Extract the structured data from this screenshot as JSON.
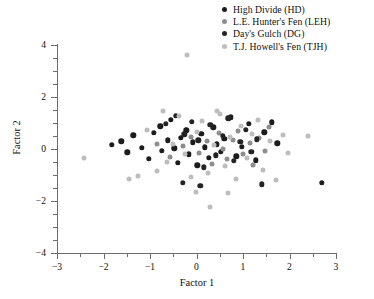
{
  "figure": {
    "title": "",
    "background": "#ffffff"
  },
  "legend": {
    "position": "top-right",
    "entries": [
      {
        "label": "High Divide (HD)",
        "key": "HD",
        "color": "#1c1c1c",
        "marker": "circle"
      },
      {
        "label": "L.E. Hunter's Fen (LEH)",
        "key": "LEH",
        "color": "#8e8e8e",
        "marker": "circle"
      },
      {
        "label": "Day's Gulch (DG)",
        "key": "DG",
        "color": "#242424",
        "marker": "circle"
      },
      {
        "label": "T.J. Howell's Fen (TJH)",
        "key": "TJH",
        "color": "#bdbdbd",
        "marker": "circle"
      }
    ]
  },
  "axes": {
    "xlabel": "Factor 1",
    "ylabel": "Factor 2",
    "xlim": [
      -3,
      3
    ],
    "ylim": [
      -4,
      4
    ],
    "xticks": [
      -3,
      -2,
      -1,
      0,
      1,
      2,
      3
    ],
    "xticklabels": [
      "−3",
      "−2",
      "−1",
      "0",
      "1",
      "2",
      "3"
    ],
    "yticks": [
      -4,
      -2,
      0,
      2,
      4
    ],
    "yticklabels": [
      "−4",
      "−2",
      "0",
      "2",
      "4"
    ],
    "xminor_step": 0.5,
    "yminor_step": 0.5,
    "grid": false,
    "axis_color": "#6d6d6d"
  },
  "chart_data": {
    "type": "scatter",
    "title": "",
    "xlabel": "Factor 1",
    "ylabel": "Factor 2",
    "xlim": [
      -3,
      3
    ],
    "ylim": [
      -4,
      4
    ],
    "grid": false,
    "legend_position": "top-right",
    "series": [
      {
        "name": "High Divide (HD)",
        "key": "HD",
        "color": "#1c1c1c",
        "points": [
          [
            -1.82,
            0.16
          ],
          [
            -1.62,
            0.3
          ],
          [
            -1.49,
            -0.12
          ],
          [
            -1.36,
            0.52
          ],
          [
            -1.18,
            0.04
          ],
          [
            -1.02,
            -0.38
          ],
          [
            -0.92,
            0.62
          ],
          [
            -0.78,
            0.88
          ],
          [
            -0.74,
            -0.08
          ],
          [
            -0.62,
            0.34
          ],
          [
            -0.55,
            1.12
          ],
          [
            -0.48,
            0.02
          ],
          [
            -0.4,
            -0.52
          ],
          [
            -0.34,
            0.44
          ],
          [
            -0.22,
            0.72
          ],
          [
            -0.16,
            -0.2
          ],
          [
            -0.08,
            0.26
          ],
          [
            0.02,
            -0.62
          ],
          [
            0.1,
            0.58
          ],
          [
            0.18,
            0.06
          ],
          [
            0.26,
            -0.34
          ],
          [
            0.36,
            0.84
          ],
          [
            0.44,
            0.18
          ],
          [
            0.52,
            -0.1
          ],
          [
            0.6,
            0.4
          ],
          [
            0.74,
            1.22
          ],
          [
            0.86,
            -0.28
          ],
          [
            0.98,
            0.08
          ],
          [
            1.12,
            0.96
          ],
          [
            1.28,
            -0.44
          ],
          [
            1.46,
            0.64
          ],
          [
            1.62,
            1.02
          ],
          [
            1.74,
            0.22
          ],
          [
            2.7,
            -1.3
          ]
        ]
      },
      {
        "name": "L.E. Hunter's Fen (LEH)",
        "key": "LEH",
        "color": "#8e8e8e",
        "points": [
          [
            -0.86,
            0.2
          ],
          [
            -0.58,
            -0.3
          ],
          [
            -0.3,
            0.1
          ],
          [
            -0.12,
            0.46
          ],
          [
            0.06,
            -0.14
          ],
          [
            0.22,
            0.3
          ],
          [
            0.34,
            -0.56
          ],
          [
            0.48,
            0.62
          ],
          [
            0.58,
            0.0
          ],
          [
            0.66,
            -0.4
          ],
          [
            0.78,
            0.34
          ],
          [
            0.9,
            0.7
          ],
          [
            1.0,
            -0.18
          ],
          [
            1.14,
            0.24
          ],
          [
            1.22,
            -0.62
          ],
          [
            1.34,
            0.42
          ],
          [
            1.48,
            -0.06
          ],
          [
            1.56,
            0.86
          ]
        ]
      },
      {
        "name": "Day's Gulch (DG)",
        "key": "DG",
        "color": "#242424",
        "points": [
          [
            -0.66,
            0.96
          ],
          [
            -0.44,
            1.28
          ],
          [
            -0.26,
            0.56
          ],
          [
            -0.1,
            1.04
          ],
          [
            0.04,
            0.34
          ],
          [
            0.16,
            -0.7
          ],
          [
            0.3,
            0.92
          ],
          [
            0.42,
            -0.24
          ],
          [
            0.56,
            0.5
          ],
          [
            0.68,
            1.18
          ],
          [
            0.8,
            -0.46
          ],
          [
            0.94,
            0.28
          ],
          [
            1.06,
            0.74
          ],
          [
            1.18,
            -0.1
          ],
          [
            1.3,
            0.38
          ],
          [
            1.4,
            -1.36
          ],
          [
            0.08,
            -1.42
          ],
          [
            -0.3,
            -1.3
          ]
        ]
      },
      {
        "name": "T.J. Howell's Fen (TJH)",
        "key": "TJH",
        "color": "#bdbdbd",
        "points": [
          [
            -0.2,
            3.6
          ],
          [
            -2.42,
            -0.36
          ],
          [
            -1.26,
            -1.02
          ],
          [
            -1.06,
            0.74
          ],
          [
            -0.84,
            -0.86
          ],
          [
            -0.64,
            -0.5
          ],
          [
            -0.5,
            0.18
          ],
          [
            -0.38,
            1.26
          ],
          [
            -0.24,
            -0.18
          ],
          [
            -0.12,
            -1.08
          ],
          [
            0.0,
            0.66
          ],
          [
            0.12,
            1.06
          ],
          [
            0.24,
            -0.92
          ],
          [
            0.38,
            0.14
          ],
          [
            0.5,
            1.34
          ],
          [
            0.62,
            -0.64
          ],
          [
            0.72,
            0.48
          ],
          [
            0.84,
            -1.14
          ],
          [
            0.96,
            0.88
          ],
          [
            1.08,
            -0.34
          ],
          [
            1.2,
            0.56
          ],
          [
            1.32,
            1.1
          ],
          [
            1.44,
            -0.8
          ],
          [
            1.58,
            0.3
          ],
          [
            1.7,
            -1.18
          ],
          [
            1.86,
            0.52
          ],
          [
            0.3,
            -2.22
          ],
          [
            0.68,
            -1.7
          ],
          [
            -0.02,
            -1.64
          ],
          [
            2.4,
            0.5
          ],
          [
            1.96,
            -0.14
          ],
          [
            -1.46,
            -1.16
          ],
          [
            -0.72,
            1.46
          ],
          [
            0.44,
            1.48
          ]
        ]
      }
    ]
  }
}
